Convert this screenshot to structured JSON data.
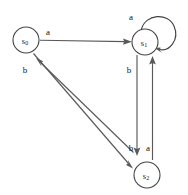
{
  "diagram": {
    "width": 188,
    "height": 195,
    "background_color": "#ffffff",
    "stroke_color": "#5a5a5a",
    "node_stroke_color": "#444444",
    "text_color": "#111111",
    "nodes": [
      {
        "id": "s0",
        "label": "s",
        "subscript": "0",
        "cx": 26,
        "cy": 40,
        "r": 13
      },
      {
        "id": "s1",
        "label": "s",
        "subscript": "1",
        "cx": 145,
        "cy": 42,
        "r": 13
      },
      {
        "id": "s2",
        "label": "s",
        "subscript": "2",
        "cx": 147,
        "cy": 175,
        "r": 13
      }
    ],
    "edges": [
      {
        "id": "s0-to-s1",
        "from": "s0",
        "to": "s1",
        "label": "a",
        "label_x": 48,
        "label_y": 32
      },
      {
        "id": "s1-self-loop",
        "from": "s1",
        "to": "s1",
        "label": "a",
        "label_x": 131,
        "label_y": 17
      },
      {
        "id": "s0-to-s2",
        "from": "s0",
        "to": "s2",
        "label": "b",
        "label_x": 25,
        "label_y": 70
      },
      {
        "id": "s2-to-s0",
        "from": "s2",
        "to": "s0",
        "label": "b",
        "label_x": 131,
        "label_y": 148
      },
      {
        "id": "s1-to-s2",
        "from": "s1",
        "to": "s2",
        "label": "b",
        "label_x": 129,
        "label_y": 70
      },
      {
        "id": "s2-to-s1",
        "from": "s2",
        "to": "s1",
        "label": "a",
        "label_x": 148,
        "label_y": 148
      }
    ],
    "alphabet": [
      "a",
      "b"
    ]
  }
}
